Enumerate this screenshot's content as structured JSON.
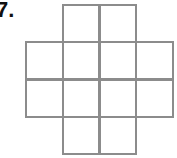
{
  "problem": {
    "label": "7."
  },
  "figure": {
    "type": "grid-of-squares",
    "line_color": "#8c8c8c",
    "origin": [
      26,
      5
    ],
    "cell_w": 36.5,
    "cell_h": 37.25,
    "rows": [
      [
        0,
        1,
        1,
        0
      ],
      [
        1,
        1,
        1,
        1
      ],
      [
        1,
        1,
        1,
        1
      ],
      [
        0,
        1,
        1,
        0
      ]
    ],
    "square_count": 12
  }
}
